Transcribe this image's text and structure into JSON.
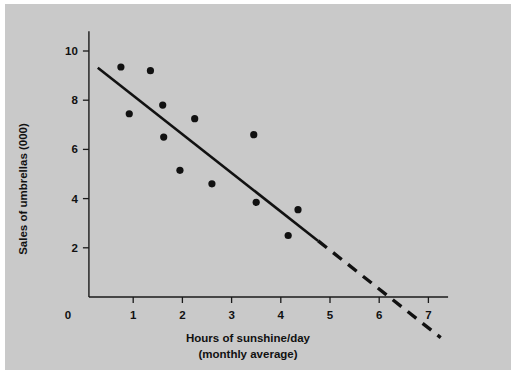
{
  "figure": {
    "background_color": "#c9c9c9",
    "page_color": "#ffffff",
    "ink_color": "#111111"
  },
  "chart_data": {
    "type": "scatter",
    "title": "",
    "xlabel": "Hours of sunshine/day",
    "xlabel_line2": "(monthly average)",
    "ylabel": "Sales of umbrellas (000)",
    "xlim": [
      0,
      7.4
    ],
    "ylim": [
      0,
      11
    ],
    "grid": false,
    "legend": null,
    "xticks": [
      0,
      1,
      2,
      3,
      4,
      5,
      6,
      7
    ],
    "xtick_labels": [
      "0",
      "1",
      "2",
      "3",
      "4",
      "5",
      "6",
      "7"
    ],
    "yticks": [
      2,
      4,
      6,
      8,
      10
    ],
    "ytick_labels": [
      "2",
      "4",
      "6",
      "8",
      "10"
    ],
    "points": [
      {
        "x": 0.75,
        "y": 9.35
      },
      {
        "x": 0.92,
        "y": 7.45
      },
      {
        "x": 1.35,
        "y": 9.2
      },
      {
        "x": 1.6,
        "y": 7.8
      },
      {
        "x": 1.62,
        "y": 6.5
      },
      {
        "x": 1.95,
        "y": 5.15
      },
      {
        "x": 2.25,
        "y": 7.25
      },
      {
        "x": 2.6,
        "y": 4.6
      },
      {
        "x": 3.45,
        "y": 6.6
      },
      {
        "x": 3.5,
        "y": 3.85
      },
      {
        "x": 4.15,
        "y": 2.5
      },
      {
        "x": 4.35,
        "y": 3.55
      }
    ],
    "trend_line": {
      "style": "solid-then-dashed",
      "solid_from": {
        "x": 0.28,
        "y": 9.32
      },
      "solid_to": {
        "x": 4.76,
        "y": 2.28
      },
      "dashed_from": {
        "x": 4.76,
        "y": 2.28
      },
      "dashed_to": {
        "x": 7.25,
        "y": -1.65
      },
      "x_intercept": 6.15
    },
    "annotations": []
  }
}
